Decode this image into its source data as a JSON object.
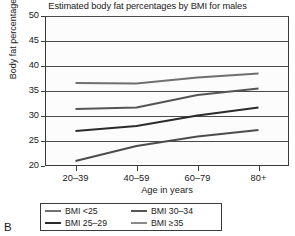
{
  "panel_label": "B",
  "chart_data": {
    "type": "line",
    "title": "Estimated body fat percentages by BMI for males",
    "xlabel": "Age in years",
    "ylabel": "Body fat percentage",
    "categories": [
      "20–39",
      "40–59",
      "60–79",
      "80+"
    ],
    "ylim": [
      20,
      50
    ],
    "yticks": [
      20,
      25,
      30,
      35,
      40,
      45,
      50
    ],
    "ytick_labels": [
      "20",
      "25",
      "30",
      "35",
      "40",
      "45",
      "50"
    ],
    "grid": true,
    "legend_position": "below",
    "series": [
      {
        "name": "BMI <25",
        "values": [
          21.0,
          24.0,
          25.9,
          27.2
        ],
        "color": "#4c4c4c"
      },
      {
        "name": "BMI 25–29",
        "values": [
          27.0,
          28.0,
          30.1,
          31.7
        ],
        "color": "#2b2b2b"
      },
      {
        "name": "BMI 30–34",
        "values": [
          31.4,
          31.7,
          34.2,
          35.5
        ],
        "color": "#555555"
      },
      {
        "name": "BMI ≥35",
        "values": [
          36.6,
          36.5,
          37.7,
          38.5
        ],
        "color": "#707070"
      }
    ]
  },
  "legend": {
    "items": [
      {
        "label": "BMI <25",
        "color": "#707070"
      },
      {
        "label": "BMI 30–34",
        "color": "#555555"
      },
      {
        "label": "BMI 25–29",
        "color": "#2b2b2b"
      },
      {
        "label": "BMI ≥35",
        "color": "#8a8a8a"
      }
    ]
  }
}
